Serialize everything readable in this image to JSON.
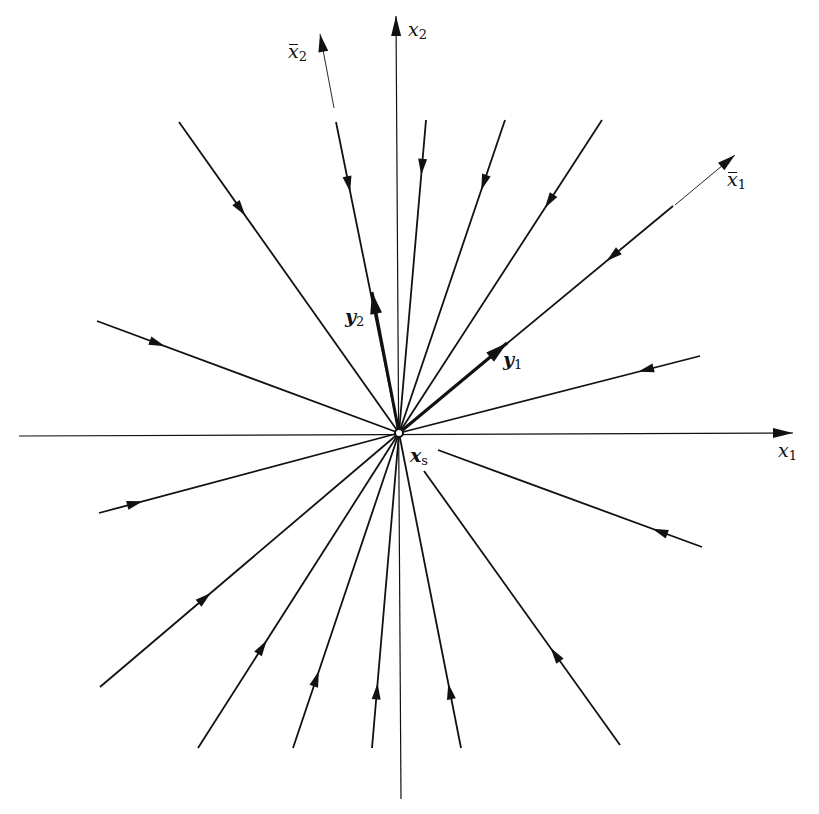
{
  "diagram": {
    "colors": {
      "background": "#ffffff",
      "stroke": "#111111"
    },
    "center": {
      "x": 399,
      "y": 433
    },
    "axes": [
      {
        "id": "x1",
        "from": [
          19,
          436
        ],
        "to": [
          793,
          433
        ],
        "label": "x",
        "sub": "1",
        "label_pos": [
          778,
          441
        ]
      },
      {
        "id": "x2",
        "from": [
          401,
          799
        ],
        "to": [
          396,
          16
        ],
        "label": "x",
        "sub": "2",
        "label_pos": [
          408,
          20
        ]
      }
    ],
    "rotated_axes": [
      {
        "id": "x1bar",
        "from": [
          675,
          205
        ],
        "to": [
          735,
          155
        ],
        "label": "x",
        "sub": "1",
        "bar": true,
        "label_pos": [
          727,
          170
        ]
      },
      {
        "id": "x2bar",
        "from": [
          334,
          108
        ],
        "to": [
          320,
          34
        ],
        "label": "x",
        "sub": "2",
        "bar": true,
        "label_pos": [
          288,
          42
        ]
      }
    ],
    "eigenvectors": [
      {
        "id": "y1",
        "from": [
          399,
          433
        ],
        "to": [
          507,
          343
        ],
        "label": "y",
        "sub": "1",
        "label_pos": [
          503,
          350
        ]
      },
      {
        "id": "y2",
        "from": [
          399,
          433
        ],
        "to": [
          372,
          292
        ],
        "label": "y",
        "sub": "2",
        "label_pos": [
          345,
          307
        ]
      }
    ],
    "trajectories": [
      {
        "from": [
          179,
          122
        ],
        "to": [
          399,
          433
        ],
        "arrow_t": 0.28
      },
      {
        "from": [
          336,
          122
        ],
        "to": [
          399,
          433
        ],
        "arrow_t": 0.2
      },
      {
        "from": [
          426,
          120
        ],
        "to": [
          399,
          433
        ],
        "arrow_t": 0.15
      },
      {
        "from": [
          505,
          120
        ],
        "to": [
          399,
          433
        ],
        "arrow_t": 0.2
      },
      {
        "from": [
          602,
          120
        ],
        "to": [
          399,
          433
        ],
        "arrow_t": 0.26
      },
      {
        "from": [
          673,
          206
        ],
        "to": [
          399,
          433
        ],
        "arrow_t": 0.22
      },
      {
        "from": [
          700,
          356
        ],
        "to": [
          399,
          433
        ],
        "arrow_t": 0.18
      },
      {
        "from": [
          97,
          321
        ],
        "to": [
          399,
          433
        ],
        "arrow_t": 0.2
      },
      {
        "from": [
          99,
          513
        ],
        "to": [
          399,
          433
        ],
        "arrow_t": 0.12
      },
      {
        "from": [
          100,
          687
        ],
        "to": [
          399,
          433
        ],
        "arrow_t": 0.35
      },
      {
        "from": [
          198,
          748
        ],
        "to": [
          399,
          433
        ],
        "arrow_t": 0.32
      },
      {
        "from": [
          293,
          748
        ],
        "to": [
          399,
          433
        ],
        "arrow_t": 0.22
      },
      {
        "from": [
          372,
          748
        ],
        "to": [
          399,
          433
        ],
        "arrow_t": 0.18
      },
      {
        "from": [
          461,
          748
        ],
        "to": [
          399,
          433
        ],
        "arrow_t": 0.18
      },
      {
        "from": [
          702,
          547
        ],
        "to": [
          438,
          450
        ],
        "arrow_t": 0.16
      },
      {
        "from": [
          620,
          745
        ],
        "to": [
          424,
          471
        ],
        "arrow_t": 0.33
      }
    ],
    "fixed_point": {
      "label": "x",
      "sub": "s",
      "label_pos": [
        410,
        446
      ]
    }
  }
}
